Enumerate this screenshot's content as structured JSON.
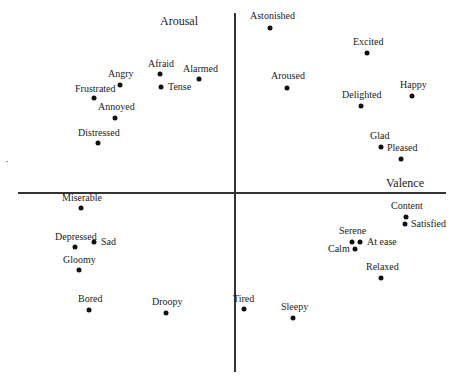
{
  "chart_data": {
    "type": "scatter",
    "title": "",
    "xlabel": "Valence",
    "ylabel": "Arousal",
    "xlim": [
      -1,
      1
    ],
    "ylim": [
      -1,
      1
    ],
    "grid": false,
    "legend": null,
    "points": [
      {
        "label": "Astonished",
        "x": 0.17,
        "y": 0.92,
        "px": 270,
        "py": 28,
        "lx": 250,
        "ly": 11,
        "anchor": "above"
      },
      {
        "label": "Excited",
        "x": 0.62,
        "y": 0.78,
        "px": 367,
        "py": 53,
        "lx": 353,
        "ly": 37,
        "anchor": "above"
      },
      {
        "label": "Aroused",
        "x": 0.25,
        "y": 0.58,
        "px": 287,
        "py": 88,
        "lx": 271,
        "ly": 71,
        "anchor": "above"
      },
      {
        "label": "Happy",
        "x": 0.82,
        "y": 0.54,
        "px": 412,
        "py": 96,
        "lx": 400,
        "ly": 80,
        "anchor": "above"
      },
      {
        "label": "Delighted",
        "x": 0.59,
        "y": 0.49,
        "px": 361,
        "py": 106,
        "lx": 342,
        "ly": 90,
        "anchor": "above"
      },
      {
        "label": "Glad",
        "x": 0.68,
        "y": 0.26,
        "px": 381,
        "py": 147,
        "lx": 370,
        "ly": 131,
        "anchor": "above"
      },
      {
        "label": "Pleased",
        "x": 0.77,
        "y": 0.19,
        "px": 401,
        "py": 159,
        "lx": 387,
        "ly": 143,
        "anchor": "above"
      },
      {
        "label": "Alarmed",
        "x": -0.16,
        "y": 0.63,
        "px": 199,
        "py": 79,
        "lx": 183,
        "ly": 64,
        "anchor": "above"
      },
      {
        "label": "Afraid",
        "x": -0.34,
        "y": 0.66,
        "px": 160,
        "py": 74,
        "lx": 148,
        "ly": 59,
        "anchor": "above"
      },
      {
        "label": "Tense",
        "x": -0.34,
        "y": 0.59,
        "px": 161,
        "py": 87,
        "lx": 168,
        "ly": 82,
        "anchor": "right"
      },
      {
        "label": "Angry",
        "x": -0.53,
        "y": 0.6,
        "px": 120,
        "py": 85,
        "lx": 108,
        "ly": 69,
        "anchor": "above"
      },
      {
        "label": "Frustrated",
        "x": -0.65,
        "y": 0.53,
        "px": 94,
        "py": 98,
        "lx": 75,
        "ly": 84,
        "anchor": "above"
      },
      {
        "label": "Annoyed",
        "x": -0.55,
        "y": 0.42,
        "px": 115,
        "py": 118,
        "lx": 98,
        "ly": 102,
        "anchor": "above"
      },
      {
        "label": "Distressed",
        "x": -0.63,
        "y": 0.28,
        "px": 98,
        "py": 143,
        "lx": 78,
        "ly": 128,
        "anchor": "above"
      },
      {
        "label": "Content",
        "x": 0.8,
        "y": -0.13,
        "px": 406,
        "py": 217,
        "lx": 391,
        "ly": 201,
        "anchor": "above"
      },
      {
        "label": "Satisfied",
        "x": 0.8,
        "y": -0.17,
        "px": 405,
        "py": 224,
        "lx": 411,
        "ly": 219,
        "anchor": "right"
      },
      {
        "label": "Serene",
        "x": 0.55,
        "y": -0.27,
        "px": 352,
        "py": 242,
        "lx": 339,
        "ly": 226,
        "anchor": "above"
      },
      {
        "label": "At ease",
        "x": 0.59,
        "y": -0.27,
        "px": 360,
        "py": 242,
        "lx": 367,
        "ly": 237,
        "anchor": "right"
      },
      {
        "label": "Calm",
        "x": 0.56,
        "y": -0.31,
        "px": 355,
        "py": 249,
        "lx": 328,
        "ly": 244,
        "anchor": "left"
      },
      {
        "label": "Relaxed",
        "x": 0.68,
        "y": -0.47,
        "px": 381,
        "py": 278,
        "lx": 366,
        "ly": 262,
        "anchor": "above"
      },
      {
        "label": "Tired",
        "x": 0.05,
        "y": -0.64,
        "px": 244,
        "py": 309,
        "lx": 233,
        "ly": 294,
        "anchor": "above"
      },
      {
        "label": "Sleepy",
        "x": 0.27,
        "y": -0.69,
        "px": 293,
        "py": 318,
        "lx": 281,
        "ly": 302,
        "anchor": "above"
      },
      {
        "label": "Miserable",
        "x": -0.71,
        "y": -0.08,
        "px": 81,
        "py": 208,
        "lx": 62,
        "ly": 193,
        "anchor": "above"
      },
      {
        "label": "Depressed",
        "x": -0.73,
        "y": -0.3,
        "px": 75,
        "py": 247,
        "lx": 55,
        "ly": 232,
        "anchor": "above"
      },
      {
        "label": "Sad",
        "x": -0.65,
        "y": -0.27,
        "px": 94,
        "py": 242,
        "lx": 101,
        "ly": 237,
        "anchor": "right"
      },
      {
        "label": "Gloomy",
        "x": -0.72,
        "y": -0.43,
        "px": 79,
        "py": 270,
        "lx": 63,
        "ly": 255,
        "anchor": "above"
      },
      {
        "label": "Bored",
        "x": -0.67,
        "y": -0.65,
        "px": 89,
        "py": 310,
        "lx": 78,
        "ly": 294,
        "anchor": "above"
      },
      {
        "label": "Droopy",
        "x": -0.31,
        "y": -0.67,
        "px": 166,
        "py": 313,
        "lx": 152,
        "ly": 297,
        "anchor": "above"
      }
    ]
  },
  "axes": {
    "x_label": "Valence",
    "y_label": "Arousal",
    "origin_px": [
      234,
      193
    ],
    "x_axis_px": [
      18,
      446
    ],
    "y_axis_px": [
      13,
      372
    ],
    "x_label_pos": [
      405,
      183
    ],
    "y_label_pos": [
      179,
      21
    ]
  },
  "colors": {
    "axis": "#333333",
    "point": "#111111",
    "text": "#222222",
    "background": "#ffffff"
  }
}
